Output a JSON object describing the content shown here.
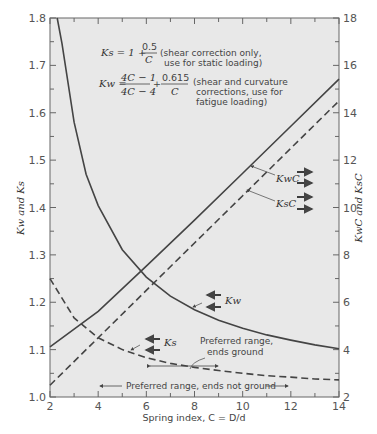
{
  "chart_data": {
    "type": "line",
    "title": "",
    "xlabel": "Spring index, C = D/d",
    "ylabel_left": "Kw and Ks",
    "ylabel_right": "KwC and KsC",
    "xlim": [
      2,
      14
    ],
    "ylim_left": [
      1.0,
      1.8
    ],
    "ylim_right": [
      2,
      18
    ],
    "x_ticks": [
      2,
      4,
      6,
      8,
      10,
      12,
      14
    ],
    "y_ticks_left": [
      1.0,
      1.1,
      1.2,
      1.3,
      1.4,
      1.5,
      1.6,
      1.7,
      1.8
    ],
    "y_ticks_right": [
      2,
      4,
      6,
      8,
      10,
      12,
      14,
      16,
      18
    ],
    "grid": false,
    "series": [
      {
        "name": "Kw",
        "axis": "left",
        "style": "solid",
        "x": [
          2.3,
          2.5,
          3,
          3.5,
          4,
          5,
          6,
          7,
          8,
          9,
          10,
          11,
          12,
          13,
          14
        ],
        "values": [
          1.8,
          1.746,
          1.58,
          1.47,
          1.404,
          1.311,
          1.253,
          1.213,
          1.184,
          1.162,
          1.145,
          1.131,
          1.12,
          1.11,
          1.102
        ]
      },
      {
        "name": "Ks",
        "axis": "left",
        "style": "dashed",
        "x": [
          2,
          3,
          4,
          5,
          6,
          7,
          8,
          9,
          10,
          11,
          12,
          13,
          14
        ],
        "values": [
          1.25,
          1.167,
          1.125,
          1.1,
          1.083,
          1.071,
          1.0625,
          1.056,
          1.05,
          1.045,
          1.042,
          1.038,
          1.036
        ]
      },
      {
        "name": "KwC",
        "axis": "right",
        "style": "solid",
        "x": [
          2,
          4,
          6,
          8,
          10,
          12,
          14
        ],
        "values": [
          4.12,
          5.62,
          7.52,
          9.47,
          11.45,
          13.43,
          15.42
        ]
      },
      {
        "name": "KsC",
        "axis": "right",
        "style": "dashed",
        "x": [
          2,
          4,
          6,
          8,
          10,
          12,
          14
        ],
        "values": [
          2.5,
          4.5,
          6.5,
          8.5,
          10.5,
          12.5,
          14.5
        ]
      }
    ],
    "annotations": [
      {
        "text": "Ks = 1 + 0.5/C (shear correction only, use for static loading)"
      },
      {
        "text": "Kw = (4C−1)/(4C−4) + 0.615/C (shear and curvature corrections, use for fatigue loading)"
      },
      {
        "text": "Preferred range, ends ground",
        "x_range": [
          5,
          9
        ]
      },
      {
        "text": "Preferred range, ends not ground",
        "x_range": [
          4,
          12
        ]
      }
    ]
  },
  "labels": {
    "x_axis": "Spring index, C = D/d",
    "y_left": "Kw and Ks",
    "y_right": "KwC and KsC",
    "ks_formula_lhs": "Ks = 1 +",
    "ks_num": "0.5",
    "ks_den": "C",
    "ks_note1": "(shear correction only,",
    "ks_note2": "use for static loading)",
    "kw_formula_lhs": "Kw =",
    "kw_num1": "4C − 1",
    "kw_den1": "4C − 4",
    "kw_plus": "+",
    "kw_num2": "0.615",
    "kw_den2": "C",
    "kw_note1": "(shear and curvature",
    "kw_note2": "corrections, use for",
    "kw_note3": "fatigue loading)",
    "curve_kwc": "KwC",
    "curve_ksc": "KsC",
    "curve_kw": "Kw",
    "curve_ks": "Ks",
    "pref_ground_1": "Preferred range,",
    "pref_ground_2": "ends ground",
    "pref_not_ground": "Preferred range, ends not ground"
  }
}
